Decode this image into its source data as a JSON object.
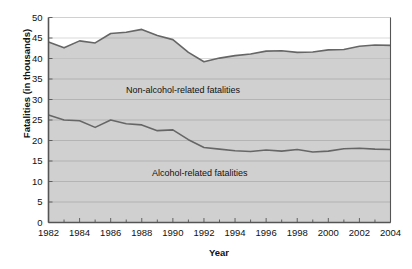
{
  "chart_data": {
    "type": "area",
    "title": "",
    "xlabel": "Year",
    "ylabel": "Fatalities (in thousands)",
    "xlim": [
      1982,
      2004
    ],
    "ylim": [
      0,
      50
    ],
    "grid": true,
    "legend_position": "inline-annotation",
    "x": [
      1982,
      1983,
      1984,
      1985,
      1986,
      1987,
      1988,
      1989,
      1990,
      1991,
      1992,
      1993,
      1994,
      1995,
      1996,
      1997,
      1998,
      1999,
      2000,
      2001,
      2002,
      2003,
      2004
    ],
    "xticklabels": [
      "1982",
      "1984",
      "1986",
      "1988",
      "1990",
      "1992",
      "1994",
      "1996",
      "1998",
      "2000",
      "2002",
      "2004"
    ],
    "xticks": [
      1982,
      1984,
      1986,
      1988,
      1990,
      1992,
      1994,
      1996,
      1998,
      2000,
      2002,
      2004
    ],
    "yticks": [
      0,
      5,
      10,
      15,
      20,
      25,
      30,
      35,
      40,
      45,
      50
    ],
    "yticklabels": [
      "0",
      "5",
      "10",
      "15",
      "20",
      "25",
      "30",
      "35",
      "40",
      "45",
      "50"
    ],
    "series": [
      {
        "name": "Alcohol-related fatalities",
        "annotation": "Alcohol-related fatalities",
        "stack_order": 1,
        "values": [
          26.2,
          25.0,
          24.8,
          23.2,
          25.0,
          24.1,
          23.8,
          22.4,
          22.6,
          20.2,
          18.3,
          17.9,
          17.5,
          17.3,
          17.7,
          17.4,
          17.8,
          17.2,
          17.4,
          18.0,
          18.1,
          17.9,
          17.8
        ]
      },
      {
        "name": "Non-alcohol-related fatalities",
        "annotation": "Non-alcohol-related fatalities",
        "stack_order": 2,
        "note": "upper boundary is cumulative total fatalities",
        "cumulative_values": [
          44.0,
          42.6,
          44.3,
          43.8,
          46.1,
          46.4,
          47.1,
          45.6,
          44.6,
          41.5,
          39.2,
          40.1,
          40.7,
          41.1,
          41.8,
          41.9,
          41.5,
          41.6,
          42.1,
          42.2,
          43.0,
          43.3,
          43.2
        ]
      }
    ],
    "colors": {
      "band_fill": "#d0d0d0",
      "line": "#666666",
      "grid": "#a8a8a8",
      "axis": "#555555",
      "text": "#111111",
      "background": "#ffffff"
    }
  }
}
